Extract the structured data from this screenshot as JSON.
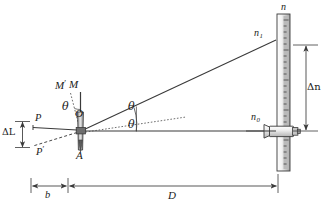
{
  "figure": {
    "type": "optics-diagram",
    "stroke_color": "#3a3a3a",
    "fill_light": "#d9d9d9",
    "fill_mid": "#a8a8a8",
    "background": "#ffffff"
  },
  "labels": {
    "mirror_rotated": "M",
    "mirror_rotated_prime": "′",
    "mirror_normal": "M",
    "theta_upper": "θ",
    "theta_mid": "θ",
    "theta_lower": "θ",
    "pivot_o": "O",
    "point_a": "A",
    "point_p": "P",
    "point_p_prime": "P",
    "prime_mark": "′",
    "delta_l": "ΔL",
    "delta_n": "Δn",
    "scale_n": "n",
    "scale_n1_base": "n",
    "scale_n1_sub": "1",
    "scale_n0_base": "n",
    "scale_n0_sub": "0",
    "dim_b": "b",
    "dim_d": "D"
  },
  "geometry": {
    "pivot": {
      "x": 81,
      "y": 131
    },
    "scale": {
      "x": 278,
      "y_top": 14,
      "y_bottom": 170,
      "width": 13
    },
    "ray_upper_end": {
      "x": 276,
      "y": 40
    },
    "ray_lower_end": {
      "x": 276,
      "y": 131
    },
    "delta_n_span": {
      "top": 45,
      "bottom": 131,
      "x": 306
    },
    "dim_b_span": {
      "left": 31,
      "right": 68,
      "y": 186
    },
    "dim_d_span": {
      "left": 68,
      "right": 278,
      "y": 186
    },
    "delta_l_span": {
      "top": 121,
      "bottom": 148,
      "x": 21
    }
  },
  "scale_ticks": {
    "count": 26,
    "major_every": 5,
    "minor_length": 5,
    "major_length": 9
  }
}
